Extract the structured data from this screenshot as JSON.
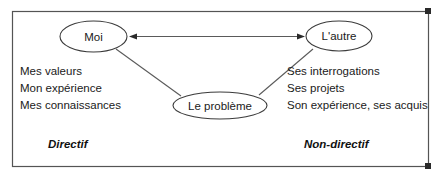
{
  "diagram": {
    "colors": {
      "frame": "#545454",
      "ellipse_stroke": "#3b3b3b",
      "connector": "#5a5a5a",
      "text": "#1a1a1a",
      "background": "#ffffff"
    },
    "nodes": [
      {
        "id": "moi",
        "label": "Moi"
      },
      {
        "id": "lautre",
        "label": "L'autre"
      },
      {
        "id": "probleme",
        "label": "Le problème"
      }
    ],
    "left_list": {
      "items": [
        "Mes valeurs",
        "Mon expérience",
        "Mes connaissances"
      ]
    },
    "right_list": {
      "items": [
        "Ses interrogations",
        "Ses projets",
        "Son expérience, ses acquis"
      ]
    },
    "poles": {
      "left_label": "Directif",
      "right_label": "Non-directif"
    },
    "connectors": [
      {
        "id": "moi-lautre",
        "type": "double-arrow"
      },
      {
        "id": "moi-probleme",
        "type": "line"
      },
      {
        "id": "lautre-probleme",
        "type": "line"
      }
    ]
  }
}
